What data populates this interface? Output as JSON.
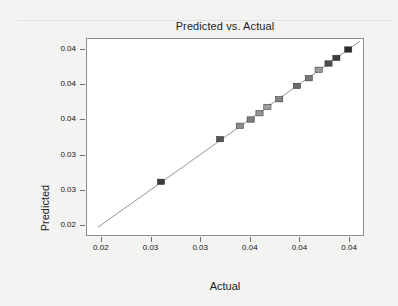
{
  "chart_data": {
    "type": "scatter",
    "title": "Predicted vs. Actual",
    "xlabel": "Actual",
    "ylabel": "Predicted",
    "grid": false,
    "legend": null,
    "xlim": [
      0.0185,
      0.0465
    ],
    "ylim": [
      0.0185,
      0.0465
    ],
    "x_tick_labels": [
      "0.02",
      "0.03",
      "0.03",
      "0.04",
      "0.04",
      "0.04"
    ],
    "x_tick_values": [
      0.02,
      0.025,
      0.03,
      0.035,
      0.04,
      0.045
    ],
    "y_tick_labels": [
      "0.02",
      "0.03",
      "0.03",
      "0.04",
      "0.04",
      "0.04"
    ],
    "y_tick_values": [
      0.02,
      0.025,
      0.03,
      0.035,
      0.04,
      0.045
    ],
    "series": [
      {
        "name": "Predicted vs. Actual",
        "marker": "square",
        "points": [
          {
            "x": 0.026,
            "y": 0.0261,
            "fill": "#3a3a3a"
          },
          {
            "x": 0.032,
            "y": 0.0322,
            "fill": "#555555"
          },
          {
            "x": 0.034,
            "y": 0.0341,
            "fill": "#8c8c8c"
          },
          {
            "x": 0.0351,
            "y": 0.035,
            "fill": "#7d7d7d"
          },
          {
            "x": 0.036,
            "y": 0.0359,
            "fill": "#949494"
          },
          {
            "x": 0.0368,
            "y": 0.0368,
            "fill": "#a0a0a0"
          },
          {
            "x": 0.038,
            "y": 0.0379,
            "fill": "#838383"
          },
          {
            "x": 0.0398,
            "y": 0.0398,
            "fill": "#6a6a6a"
          },
          {
            "x": 0.041,
            "y": 0.0409,
            "fill": "#7a7a7a"
          },
          {
            "x": 0.042,
            "y": 0.0421,
            "fill": "#9b9b9b"
          },
          {
            "x": 0.043,
            "y": 0.043,
            "fill": "#4d4d4d"
          },
          {
            "x": 0.0438,
            "y": 0.0438,
            "fill": "#3f3f3f"
          },
          {
            "x": 0.045,
            "y": 0.045,
            "fill": "#2b2b2b"
          }
        ]
      }
    ],
    "reference_line": {
      "name": "identity-fit-line",
      "x0": 0.0196,
      "y0": 0.0196,
      "x1": 0.0462,
      "y1": 0.0462,
      "color": "#8a8a8a"
    }
  },
  "colors": {
    "page_background": "#f3f3f1",
    "plot_background": "#ffffff",
    "frame": "#8d8d8d",
    "text": "#1d1d1d",
    "tick": "#6f6f6f",
    "line": "#8a8a8a"
  }
}
